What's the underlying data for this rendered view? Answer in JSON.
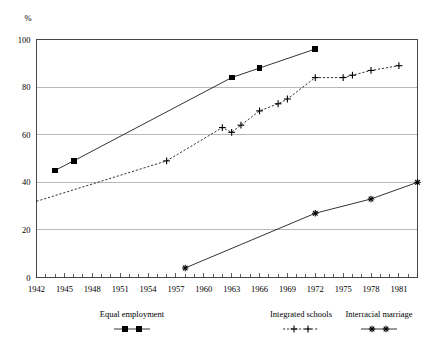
{
  "chart_data": {
    "type": "line",
    "title": "",
    "subtitle": "",
    "xlabel": "",
    "ylabel": "%",
    "ylim": [
      0,
      100
    ],
    "xlim": [
      1942,
      1983
    ],
    "yticks": [
      0,
      20,
      40,
      60,
      80,
      100
    ],
    "ytick_labels": [
      "0",
      "20",
      "40",
      "60",
      "80",
      "100"
    ],
    "xticks": [
      1942,
      1945,
      1948,
      1951,
      1954,
      1957,
      1960,
      1963,
      1966,
      1969,
      1972,
      1975,
      1978,
      1981
    ],
    "xtick_labels": [
      "1942",
      "1945",
      "1948",
      "1951",
      "1954",
      "1957",
      "1960",
      "1963",
      "1966",
      "1969",
      "1972",
      "1975",
      "1978",
      "1981"
    ],
    "xtick_minor_step": 1,
    "grid": "horizontal",
    "legend_position": "below",
    "series": [
      {
        "name": "Equal employment",
        "marker": "square",
        "line_style": "solid",
        "color": "#000000",
        "points": [
          {
            "x": 1944,
            "y": 45
          },
          {
            "x": 1946,
            "y": 49
          },
          {
            "x": 1963,
            "y": 84
          },
          {
            "x": 1966,
            "y": 88
          },
          {
            "x": 1972,
            "y": 96
          }
        ]
      },
      {
        "name": "Integrated schools",
        "marker": "plus",
        "line_style": "dashed",
        "color": "#000000",
        "points": [
          {
            "x": 1942,
            "y": 32
          },
          {
            "x": 1956,
            "y": 49
          },
          {
            "x": 1962,
            "y": 63
          },
          {
            "x": 1963,
            "y": 61
          },
          {
            "x": 1964,
            "y": 64
          },
          {
            "x": 1966,
            "y": 70
          },
          {
            "x": 1968,
            "y": 73
          },
          {
            "x": 1969,
            "y": 75
          },
          {
            "x": 1972,
            "y": 84
          },
          {
            "x": 1975,
            "y": 84
          },
          {
            "x": 1976,
            "y": 85
          },
          {
            "x": 1978,
            "y": 87
          },
          {
            "x": 1981,
            "y": 89
          }
        ]
      },
      {
        "name": "Interracial marriage",
        "marker": "star",
        "line_style": "solid",
        "color": "#000000",
        "points": [
          {
            "x": 1958,
            "y": 4
          },
          {
            "x": 1972,
            "y": 27
          },
          {
            "x": 1978,
            "y": 33
          },
          {
            "x": 1983,
            "y": 40
          }
        ]
      }
    ]
  },
  "legend": {
    "items": [
      {
        "label": "Equal employment",
        "marker": "square",
        "line_style": "solid"
      },
      {
        "label": "Integrated schools",
        "marker": "plus",
        "line_style": "dashed"
      },
      {
        "label": "Interracial marriage",
        "marker": "star",
        "line_style": "solid"
      }
    ]
  },
  "colors": {
    "ink": "#000000",
    "grid": "#9a9a9a",
    "frame": "#333333",
    "background": "#ffffff"
  }
}
